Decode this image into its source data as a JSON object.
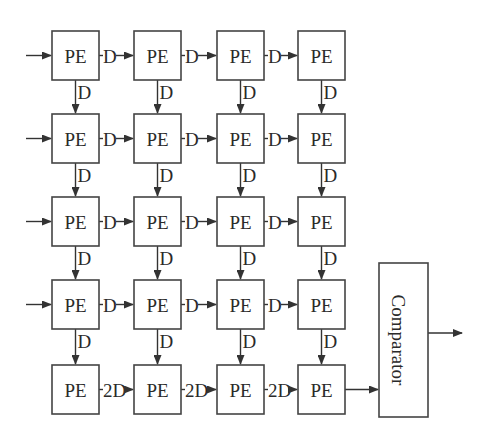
{
  "diagram": {
    "title": "",
    "rows": 5,
    "cols": 4,
    "pe_label": "PE",
    "horizontal_delay_label": "D",
    "vertical_delay_label": "D",
    "last_row_delay_label": "2D",
    "comparator_label": "Comparator",
    "colors": {
      "stroke": "#444444",
      "text": "#2a2a2a",
      "background": "#ffffff"
    },
    "grid": {
      "col_x": [
        52,
        134,
        217,
        298
      ],
      "row_y": [
        31,
        114,
        197,
        280,
        365
      ],
      "box_w": 47,
      "box_h": 49
    },
    "comparator": {
      "x": 379,
      "y": 263,
      "w": 49,
      "h": 154
    },
    "inputs_on_rows": [
      0,
      1,
      2,
      3
    ],
    "output_arrow": {
      "from_x": 428,
      "to_x": 462,
      "y": 333
    }
  }
}
